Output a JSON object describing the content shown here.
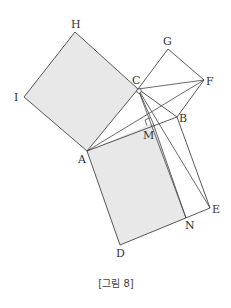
{
  "figure": {
    "caption": "[그림 8]",
    "fill_color": "#e8e8e8",
    "line_color": "#444444",
    "points": {
      "H": {
        "label": "H",
        "x": 75,
        "y": 32
      },
      "I": {
        "label": "I",
        "x": 24,
        "y": 97
      },
      "C": {
        "label": "C",
        "x": 138,
        "y": 89
      },
      "A": {
        "label": "A",
        "x": 87,
        "y": 151
      },
      "G": {
        "label": "G",
        "x": 168,
        "y": 49
      },
      "F": {
        "label": "F",
        "x": 204,
        "y": 80
      },
      "B": {
        "label": "B",
        "x": 177,
        "y": 117
      },
      "M": {
        "label": "M",
        "x": 153,
        "y": 123
      },
      "D": {
        "label": "D",
        "x": 120,
        "y": 245
      },
      "N": {
        "label": "N",
        "x": 186,
        "y": 218
      },
      "E": {
        "label": "E",
        "x": 210,
        "y": 208
      }
    }
  }
}
